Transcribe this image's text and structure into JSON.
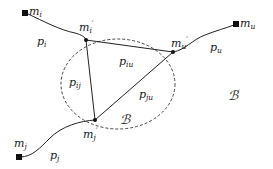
{
  "diagram": {
    "type": "network-path-diagram",
    "colors": {
      "line": "#222222",
      "node": "#111111",
      "ellipse": "#333333",
      "background": "#ffffff"
    },
    "ellipse": {
      "label": "ℬ",
      "style": "dashed"
    },
    "outer_region": {
      "label": "ℬ",
      "prime": "′"
    },
    "endpoints": [
      {
        "id": "mi",
        "base": "m",
        "sub": "i"
      },
      {
        "id": "mu",
        "base": "m",
        "sub": "u"
      },
      {
        "id": "mj",
        "base": "m",
        "sub": "j"
      }
    ],
    "inner_nodes": [
      {
        "id": "mi_prime",
        "base": "m",
        "sub": "i",
        "prime": "′"
      },
      {
        "id": "mu_prime",
        "base": "m",
        "sub": "u",
        "prime": "′"
      },
      {
        "id": "mj_prime",
        "base": "m",
        "sub": "j",
        "prime": "′"
      }
    ],
    "paths": [
      {
        "id": "pi",
        "base": "p",
        "sub": "i"
      },
      {
        "id": "pu",
        "base": "p",
        "sub": "u"
      },
      {
        "id": "pj",
        "base": "p",
        "sub": "j"
      },
      {
        "id": "pij",
        "base": "p",
        "sub": "ij"
      },
      {
        "id": "piu",
        "base": "p",
        "sub": "iu"
      },
      {
        "id": "pju",
        "base": "p",
        "sub": "ju"
      }
    ]
  }
}
